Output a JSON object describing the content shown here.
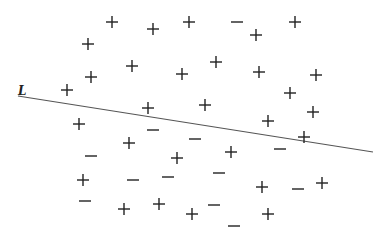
{
  "diagram": {
    "title": "",
    "line": {
      "label": "L",
      "label_pos": [
        18,
        84
      ],
      "x1": 18,
      "y1": 96,
      "x2": 373,
      "y2": 152,
      "color": "#555555"
    },
    "symbol_color": "#222222",
    "points": [
      {
        "sign": "+",
        "x": 112,
        "y": 22
      },
      {
        "sign": "+",
        "x": 153,
        "y": 29
      },
      {
        "sign": "+",
        "x": 189,
        "y": 22
      },
      {
        "sign": "-",
        "x": 237,
        "y": 22
      },
      {
        "sign": "+",
        "x": 256,
        "y": 35
      },
      {
        "sign": "+",
        "x": 295,
        "y": 22
      },
      {
        "sign": "+",
        "x": 88,
        "y": 44
      },
      {
        "sign": "+",
        "x": 132,
        "y": 66
      },
      {
        "sign": "+",
        "x": 182,
        "y": 74
      },
      {
        "sign": "+",
        "x": 216,
        "y": 62
      },
      {
        "sign": "+",
        "x": 259,
        "y": 72
      },
      {
        "sign": "+",
        "x": 316,
        "y": 75
      },
      {
        "sign": "+",
        "x": 91,
        "y": 77
      },
      {
        "sign": "+",
        "x": 67,
        "y": 90
      },
      {
        "sign": "+",
        "x": 290,
        "y": 93
      },
      {
        "sign": "+",
        "x": 148,
        "y": 108
      },
      {
        "sign": "+",
        "x": 205,
        "y": 105
      },
      {
        "sign": "+",
        "x": 313,
        "y": 112
      },
      {
        "sign": "+",
        "x": 79,
        "y": 124
      },
      {
        "sign": "-",
        "x": 153,
        "y": 130
      },
      {
        "sign": "+",
        "x": 268,
        "y": 121
      },
      {
        "sign": "+",
        "x": 304,
        "y": 137
      },
      {
        "sign": "+",
        "x": 129,
        "y": 143
      },
      {
        "sign": "-",
        "x": 195,
        "y": 139
      },
      {
        "sign": "-",
        "x": 280,
        "y": 149
      },
      {
        "sign": "+",
        "x": 231,
        "y": 152
      },
      {
        "sign": "-",
        "x": 91,
        "y": 156
      },
      {
        "sign": "+",
        "x": 177,
        "y": 158
      },
      {
        "sign": "+",
        "x": 83,
        "y": 180
      },
      {
        "sign": "-",
        "x": 133,
        "y": 180
      },
      {
        "sign": "-",
        "x": 168,
        "y": 177
      },
      {
        "sign": "-",
        "x": 219,
        "y": 173
      },
      {
        "sign": "+",
        "x": 262,
        "y": 187
      },
      {
        "sign": "-",
        "x": 298,
        "y": 189
      },
      {
        "sign": "+",
        "x": 322,
        "y": 183
      },
      {
        "sign": "-",
        "x": 85,
        "y": 201
      },
      {
        "sign": "+",
        "x": 124,
        "y": 209
      },
      {
        "sign": "+",
        "x": 159,
        "y": 204
      },
      {
        "sign": "+",
        "x": 192,
        "y": 214
      },
      {
        "sign": "-",
        "x": 214,
        "y": 205
      },
      {
        "sign": "-",
        "x": 234,
        "y": 226
      },
      {
        "sign": "+",
        "x": 268,
        "y": 214
      }
    ]
  }
}
